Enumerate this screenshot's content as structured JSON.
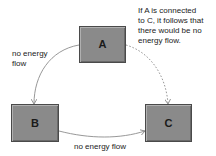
{
  "diagram": {
    "type": "energy-flow-triangle",
    "nodes": [
      {
        "id": "A",
        "label": "A"
      },
      {
        "id": "B",
        "label": "B"
      },
      {
        "id": "C",
        "label": "C"
      }
    ],
    "edges": [
      {
        "from": "A",
        "to": "B",
        "style": "solid",
        "label": "no energy flow"
      },
      {
        "from": "B",
        "to": "C",
        "style": "solid",
        "label": "no energy flow"
      },
      {
        "from": "A",
        "to": "C",
        "style": "dashed",
        "label": ""
      }
    ],
    "labels": {
      "ab": "no energy\nflow",
      "bc": "no energy flow",
      "note": "If A is connected\nto C, it follows that\nthere would be no\nenergy flow."
    },
    "colors": {
      "node_fill": "#8a8a8a",
      "node_border": "#4a4a4a",
      "line": "#8c8c8c",
      "text": "#222222"
    }
  }
}
